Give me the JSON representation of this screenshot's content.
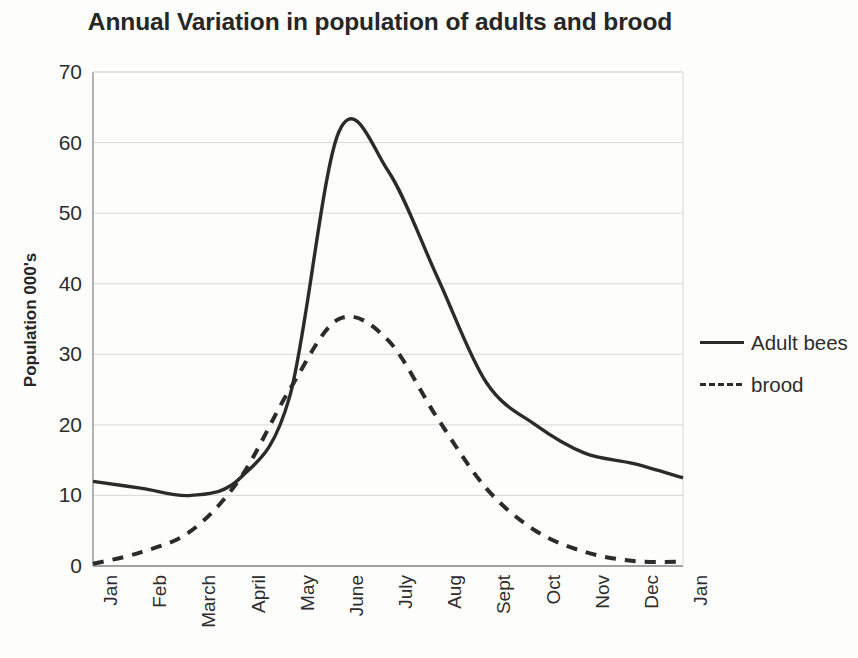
{
  "chart_data": {
    "type": "line",
    "title": "Annual Variation in population of adults and brood",
    "xlabel": "",
    "ylabel": "Population 000's",
    "categories": [
      "Jan",
      "Feb",
      "March",
      "April",
      "May",
      "June",
      "July",
      "Aug",
      "Sept",
      "Oct",
      "Nov",
      "Dec",
      "Jan"
    ],
    "series": [
      {
        "name": "Adult bees",
        "style": "solid",
        "color": "#2b2b2b",
        "values": [
          12,
          11,
          10,
          12.5,
          24,
          61.5,
          56,
          41,
          26,
          20,
          16,
          14.5,
          12.5
        ]
      },
      {
        "name": "brood",
        "style": "dashed",
        "color": "#2b2b2b",
        "values": [
          0.3,
          2,
          5,
          12.5,
          25,
          35,
          32,
          21,
          11,
          5,
          2,
          0.7,
          0.6
        ]
      }
    ],
    "ylim": [
      0,
      70
    ],
    "yticks": [
      0,
      10,
      20,
      30,
      40,
      50,
      60,
      70
    ],
    "ytick_labels": [
      "0",
      "10",
      "20",
      "30",
      "40",
      "50",
      "60",
      "70"
    ],
    "grid": "horizontal",
    "grid_color": "#d9d9d9",
    "legend_position": "right",
    "axis_color": "#8a8a8a",
    "background": "#fdfdfc"
  }
}
